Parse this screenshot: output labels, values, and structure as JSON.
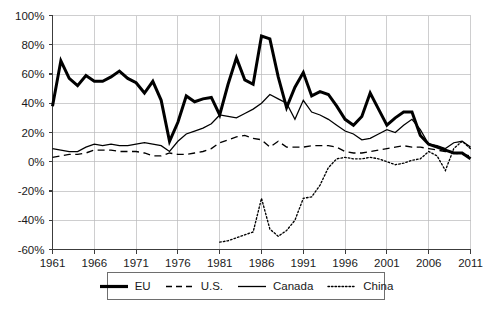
{
  "chart_data": {
    "type": "line",
    "title": "",
    "subtitle": "",
    "xlabel": "",
    "ylabel": "",
    "xlim": [
      1961,
      2011
    ],
    "ylim": [
      -60,
      100
    ],
    "y_tick_step": 20,
    "x_tick_step": 5,
    "grid": true,
    "y_tick_labels": [
      "100%",
      "80%",
      "60%",
      "40%",
      "20%",
      "0%",
      "-20%",
      "-40%",
      "-60%"
    ],
    "y_tick_values": [
      100,
      80,
      60,
      40,
      20,
      0,
      -20,
      -40,
      -60
    ],
    "x_tick_labels": [
      "1961",
      "1966",
      "1971",
      "1976",
      "1981",
      "1986",
      "1991",
      "1996",
      "2001",
      "2006",
      "2011"
    ],
    "x_tick_values": [
      1961,
      1966,
      1971,
      1976,
      1981,
      1986,
      1991,
      1996,
      2001,
      2006,
      2011
    ],
    "legend_position": "bottom",
    "series": [
      {
        "name": "EU",
        "style": "thick-solid",
        "color": "#000000",
        "x_start": 1961,
        "values": [
          38,
          69,
          57,
          52,
          59,
          55,
          55,
          58,
          62,
          57,
          54,
          47,
          55,
          42,
          14,
          27,
          45,
          41,
          43,
          44,
          32,
          53,
          71,
          56,
          53,
          86,
          84,
          58,
          37,
          51,
          61,
          45,
          48,
          46,
          38,
          29,
          25,
          31,
          47,
          36,
          25,
          30,
          34,
          34,
          18,
          12,
          10,
          8,
          6,
          6,
          2
        ]
      },
      {
        "name": "U.S.",
        "style": "dashed",
        "color": "#000000",
        "x_start": 1961,
        "values": [
          3,
          4,
          5,
          5,
          6,
          8,
          8,
          8,
          7,
          7,
          7,
          6,
          4,
          4,
          6,
          5,
          5,
          6,
          7,
          9,
          13,
          15,
          17,
          18,
          16,
          15,
          10,
          14,
          10,
          10,
          10,
          11,
          11,
          11,
          10,
          7,
          6,
          6,
          7,
          8,
          9,
          10,
          11,
          10,
          10,
          9,
          8,
          7,
          6,
          5,
          4
        ]
      },
      {
        "name": "Canada",
        "style": "thin-solid",
        "color": "#000000",
        "x_start": 1961,
        "values": [
          9,
          8,
          7,
          7,
          10,
          12,
          11,
          12,
          11,
          11,
          12,
          13,
          12,
          11,
          7,
          14,
          19,
          21,
          23,
          26,
          32,
          31,
          30,
          33,
          36,
          40,
          46,
          43,
          40,
          29,
          42,
          34,
          32,
          29,
          25,
          21,
          19,
          15,
          16,
          19,
          22,
          20,
          25,
          29,
          22,
          12,
          11,
          9,
          13,
          14,
          10
        ]
      },
      {
        "name": "China",
        "style": "dotted",
        "color": "#000000",
        "x_start": 1981,
        "values": [
          -55,
          -54,
          -52,
          -50,
          -48,
          -25,
          -46,
          -51,
          -47,
          -40,
          -25,
          -24,
          -16,
          -4,
          2,
          3,
          2,
          2,
          3,
          2,
          0,
          -2,
          -1,
          1,
          2,
          7,
          4,
          -6,
          9,
          14,
          9
        ]
      }
    ]
  },
  "legend": {
    "entries": [
      {
        "label": "EU",
        "swatch": "thick-solid-line-icon"
      },
      {
        "label": "U.S.",
        "swatch": "dashed-line-icon"
      },
      {
        "label": "Canada",
        "swatch": "thin-solid-line-icon"
      },
      {
        "label": "China",
        "swatch": "dotted-line-icon"
      }
    ]
  }
}
